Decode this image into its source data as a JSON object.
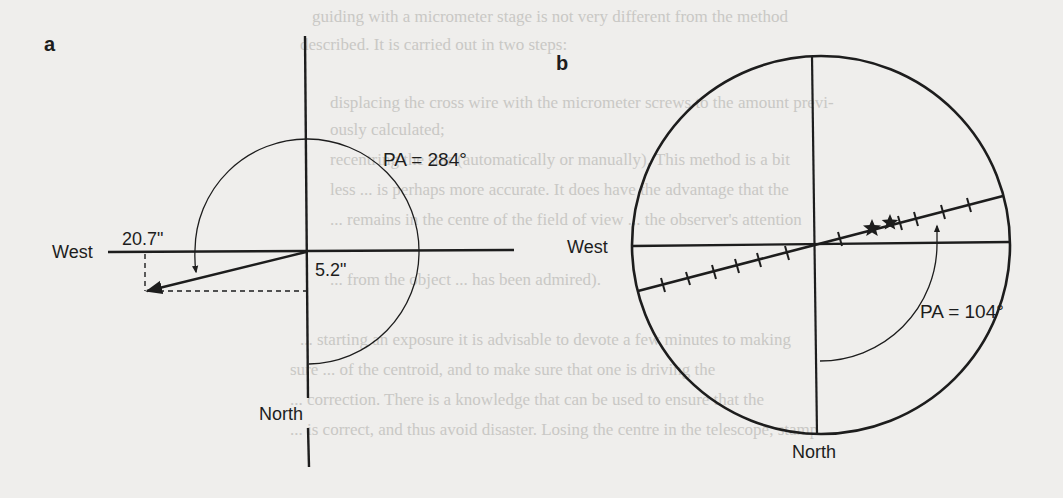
{
  "figure": {
    "panel_a": {
      "letter": "a",
      "west_label": "West",
      "north_label": "North",
      "pa_label": "PA = 284°",
      "offset_ra_label": "20.7\"",
      "offset_dec_label": "5.2\""
    },
    "panel_b": {
      "letter": "b",
      "west_label": "West",
      "north_label": "North",
      "pa_label": "PA = 104°"
    },
    "colors": {
      "ink": "#1d1d1d",
      "paper": "#efeeec",
      "bleed_text": "#c9c8c5"
    }
  },
  "bleed_through_text": [
    "guiding with a micrometer stage is not very different from the method",
    "described. It is carried out in two steps:",
    "displacing the cross wire with the micrometer screws to the amount previ-",
    "ously calculated;",
    "recentring the star (automatically or manually). This method is a bit",
    "less ... is perhaps more accurate. It does have the advantage that the",
    "... remains in the centre of the field of view ... the observer's attention",
    "... from the object ... has been admired).",
    "... starting an exposure it is advisable to devote a few minutes to making",
    "sure ... of the centroid, and to make sure that one is driving the",
    "... correction. There is a knowledge that can be used to ensure that the",
    "... is correct, and thus avoid disaster. Losing the centre in the telescope, stamp"
  ]
}
